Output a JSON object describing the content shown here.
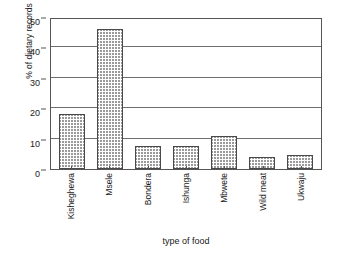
{
  "chart_data": {
    "type": "bar",
    "title": "",
    "xlabel": "type of food",
    "ylabel": "% of dietary records",
    "categories": [
      "Kisheghewa",
      "Msele",
      "Bondera",
      "Ishunga",
      "Mbwete",
      "Wild meat",
      "Ukwaju"
    ],
    "values": [
      18,
      46,
      7.5,
      7.5,
      11,
      4,
      4.5
    ],
    "ylim": [
      0,
      50
    ],
    "yticks": [
      0,
      10,
      20,
      30,
      40,
      50
    ],
    "ytick_labels": [
      "0",
      "10",
      "20",
      "30",
      "40",
      "50"
    ],
    "grid": "horizontal",
    "legend": "none",
    "bar_fill": "#ffffff",
    "bar_hatch_color": "#9a9a9a",
    "bar_edge_color": "#4a4a4a",
    "gridline_color": "#6f6f6f",
    "axis_color": "#555555",
    "background": "#ffffff"
  }
}
